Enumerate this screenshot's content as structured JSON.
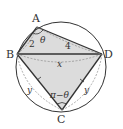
{
  "diagram": {
    "type": "cyclic-quadrilateral",
    "points": {
      "A": "A",
      "B": "B",
      "C": "C",
      "D": "D"
    },
    "edge_labels": {
      "AB": "2",
      "AD": "4",
      "BD": "x",
      "BC": "y",
      "CD": "y"
    },
    "angle_labels": {
      "A": "θ",
      "C": "π−θ"
    },
    "colors": {
      "stroke": "#333333",
      "fill": "#d9d9d9",
      "dashed": "#888888"
    }
  }
}
